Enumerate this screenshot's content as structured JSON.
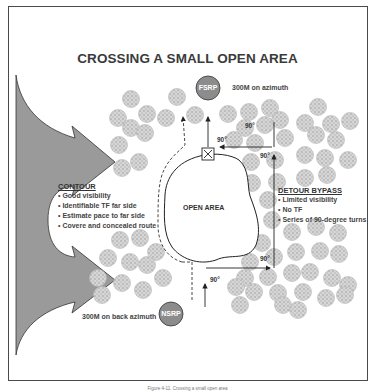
{
  "diagram": {
    "title": "CROSSING A SMALL OPEN AREA",
    "fsrp": {
      "label": "FSRP",
      "note": "300M on azimuth"
    },
    "nsrp": {
      "label": "NSRP",
      "note": "300M on back azimuth"
    },
    "open_area_label": "OPEN AREA",
    "contour": {
      "heading": "CONTOUR",
      "items": [
        "• Good visibility",
        "• Identifiable TF far side",
        "• Estimate pace to far side",
        "• Covere and concealed route"
      ]
    },
    "detour_bypass": {
      "heading": "DETOUR BYPASS",
      "items": [
        "• Limited visibility",
        "• No TF",
        "• Series of 90-degree turns"
      ]
    },
    "angle_labels": [
      "90°",
      "90°",
      "90°",
      "90°",
      "90°",
      "90°"
    ],
    "caption": "Figure 4-11. Crossing a small open area",
    "colors": {
      "tree": "#bdbdbd",
      "arrow_fill": "#9a9a9a",
      "circle_fill": "#8c8c8c",
      "line": "#222222"
    }
  }
}
